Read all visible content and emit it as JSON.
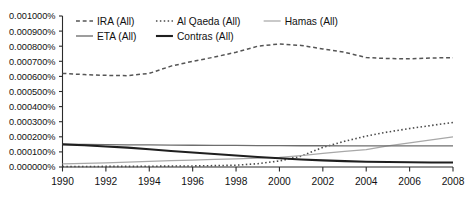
{
  "chart_data": {
    "type": "line",
    "title": "",
    "subtitle": "",
    "xlabel": "",
    "ylabel": "",
    "grid": false,
    "legend_position": "top",
    "xlim": [
      1990,
      2008
    ],
    "ylim": [
      0.0,
      0.001
    ],
    "x": [
      1990,
      1991,
      1992,
      1993,
      1994,
      1995,
      1996,
      1997,
      1998,
      1999,
      2000,
      2001,
      2002,
      2003,
      2004,
      2005,
      2006,
      2007,
      2008
    ],
    "xtick_labels": [
      "1990",
      "1992",
      "1994",
      "1996",
      "1998",
      "2000",
      "2002",
      "2004",
      "2006",
      "2008"
    ],
    "xticks": [
      1990,
      1992,
      1994,
      1996,
      1998,
      2000,
      2002,
      2004,
      2006,
      2008
    ],
    "ytick_labels": [
      "0.001000%",
      "0.000900%",
      "0.000800%",
      "0.000700%",
      "0.000600%",
      "0.000500%",
      "0.000400%",
      "0.000300%",
      "0.000200%",
      "0.000100%",
      "0.000000%"
    ],
    "yticks": [
      0.001,
      0.0009,
      0.0008,
      0.0007,
      0.0006,
      0.0005,
      0.0004,
      0.0003,
      0.0002,
      0.0001,
      0.0
    ],
    "series": [
      {
        "name": "IRA (All)",
        "style": "dashed",
        "color": "#555555",
        "width": 1.5,
        "values": [
          0.00062,
          0.000612,
          0.000607,
          0.000605,
          0.00062,
          0.000668,
          0.0007,
          0.000728,
          0.00076,
          0.0008,
          0.000815,
          0.000805,
          0.000782,
          0.00076,
          0.000725,
          0.000718,
          0.000717,
          0.000722,
          0.000724
        ]
      },
      {
        "name": "Al Qaeda (All)",
        "style": "dotted",
        "color": "#4a4a4a",
        "width": 1.6,
        "values": [
          3e-06,
          3e-06,
          4e-06,
          4e-06,
          5e-06,
          6e-06,
          7e-06,
          9e-06,
          1.2e-05,
          2.2e-05,
          4e-05,
          7.2e-05,
          0.00013,
          0.00017,
          0.000205,
          0.000232,
          0.000255,
          0.000275,
          0.000295
        ]
      },
      {
        "name": "Hamas (All)",
        "style": "solid",
        "color": "#a8a8a8",
        "width": 1.25,
        "values": [
          2e-05,
          2.4e-05,
          2.8e-05,
          3.3e-05,
          3.8e-05,
          4.2e-05,
          4.6e-05,
          5e-05,
          5.4e-05,
          5.8e-05,
          6.4e-05,
          7.5e-05,
          9e-05,
          0.000103,
          0.000115,
          0.00014,
          0.00016,
          0.00018,
          0.0002
        ]
      },
      {
        "name": "ETA (All)",
        "style": "solid",
        "color": "#6e6e6e",
        "width": 1.35,
        "values": [
          0.00015,
          0.000149,
          0.000148,
          0.000147,
          0.000146,
          0.000145,
          0.000144,
          0.000143,
          0.000143,
          0.000142,
          0.000142,
          0.000141,
          0.000141,
          0.00014,
          0.00014,
          0.00014,
          0.00014,
          0.00014,
          0.00014
        ]
      },
      {
        "name": "Contras (All)",
        "style": "solid",
        "color": "#1f1f1f",
        "width": 2.1,
        "values": [
          0.00015,
          0.000144,
          0.000136,
          0.000128,
          0.000118,
          0.000106,
          9.6e-05,
          8.6e-05,
          7.6e-05,
          6.6e-05,
          5.8e-05,
          5e-05,
          4.4e-05,
          3.9e-05,
          3.5e-05,
          3.3e-05,
          3.1e-05,
          3e-05,
          3e-05
        ]
      }
    ]
  },
  "legend": {
    "row1": [
      {
        "label": "IRA (All)"
      },
      {
        "label": "Al Qaeda (All)"
      },
      {
        "label": "Hamas (All)"
      }
    ],
    "row2": [
      {
        "label": "ETA (All)"
      },
      {
        "label": "Contras (All)"
      }
    ]
  }
}
